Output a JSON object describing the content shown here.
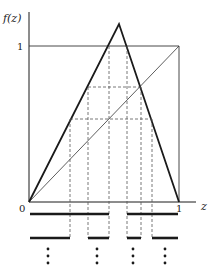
{
  "figure": {
    "y_axis_label": "f(z)",
    "x_axis_label": "z",
    "origin_label": "0",
    "x_one_label": "1",
    "y_one_label": "1"
  },
  "geometry": {
    "origin": [
      29,
      202
    ],
    "x_one": 179,
    "y_one": 46,
    "peak": [
      119,
      24
    ],
    "levels_y": [
      87,
      119
    ],
    "cut_x": [
      70,
      88,
      109,
      127,
      141,
      152
    ],
    "bar_rows": [
      {
        "y": 214,
        "segments": [
          [
            30,
            109
          ],
          [
            127,
            178
          ]
        ]
      },
      {
        "y": 238,
        "segments": [
          [
            30,
            70
          ],
          [
            88,
            109
          ],
          [
            127,
            141
          ],
          [
            152,
            178
          ]
        ]
      }
    ],
    "ellipsis_x": [
      48,
      97,
      133,
      165
    ]
  },
  "colors": {
    "ink": "#1a1a1a",
    "dash": "#555555"
  }
}
